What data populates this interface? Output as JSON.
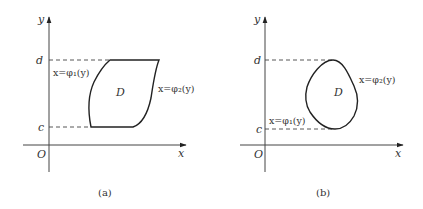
{
  "panels": [
    {
      "id": "a",
      "caption": "(a)",
      "axis_labels": {
        "x": "x",
        "y": "y",
        "origin": "O"
      },
      "tick_labels": {
        "top": "d",
        "bottom": "c"
      },
      "region_label": "D",
      "left_boundary": "x=φ₁(y)",
      "right_boundary": "x=φ₂(y)",
      "shape": "Y-type region between horizontal lines y=c and y=d bounded left and right by curves"
    },
    {
      "id": "b",
      "caption": "(b)",
      "axis_labels": {
        "x": "x",
        "y": "y",
        "origin": "O"
      },
      "tick_labels": {
        "top": "d",
        "bottom": "c"
      },
      "region_label": "D",
      "left_boundary": "x=φ₁(y)",
      "right_boundary": "x=φ₂(y)",
      "shape": "Closed convex region touching y=c and y=d at single points"
    }
  ]
}
